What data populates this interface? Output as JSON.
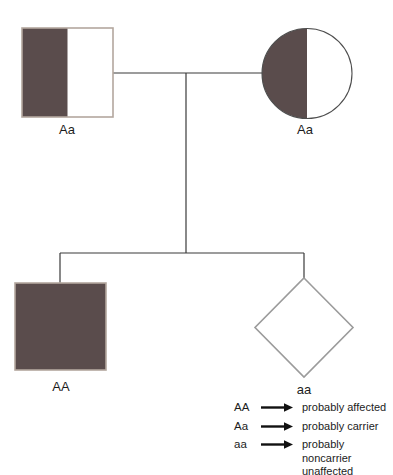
{
  "diagram": {
    "type": "pedigree-chart",
    "colors": {
      "carrier_fill": "#5a4c4c",
      "square_outline": "#b3a79e",
      "circle_outline": "#4e4e4e",
      "diamond_outline": "#9b9b9b",
      "connector_line": "#3a3a3a",
      "arrow": "#111111"
    },
    "individuals": [
      {
        "id": "father",
        "shape": "square",
        "shading": "half-left",
        "label": "Aa"
      },
      {
        "id": "mother",
        "shape": "circle",
        "shading": "half-left",
        "label": "Aa"
      },
      {
        "id": "child-1",
        "shape": "square",
        "shading": "full",
        "label": "AA"
      },
      {
        "id": "child-2",
        "shape": "diamond",
        "shading": "none",
        "label": "aa"
      }
    ]
  },
  "legend": {
    "rows": [
      {
        "symbol": "AA",
        "lines": [
          "probably affected"
        ]
      },
      {
        "symbol": "Aa",
        "lines": [
          "probably carrier"
        ]
      },
      {
        "symbol": "aa",
        "lines": [
          "probably noncarrier",
          "unaffected"
        ]
      }
    ]
  }
}
